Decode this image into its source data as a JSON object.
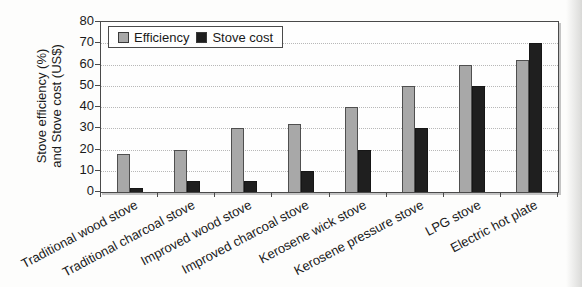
{
  "figure": {
    "y_axis_label_line1": "Stove efficiency (%)",
    "y_axis_label_line2": "and Stove cost (US$)"
  },
  "chart_data": {
    "type": "bar",
    "categories": [
      "Traditional wood stove",
      "Traditional charcoal stove",
      "Improved wood stove",
      "Improved charcoal stove",
      "Kerosene wick stove",
      "Kerosene pressure stove",
      "LPG stove",
      "Electric hot plate"
    ],
    "series": [
      {
        "name": "Efficiency",
        "values": [
          18,
          20,
          30,
          32,
          40,
          50,
          60,
          62
        ],
        "color": "#a8a8a8"
      },
      {
        "name": "Stove cost",
        "values": [
          2,
          5,
          5,
          10,
          20,
          30,
          50,
          70
        ],
        "color": "#1f1f1f"
      }
    ],
    "title": "",
    "xlabel": "",
    "ylabel": "Stove efficiency (%) and Stove cost (US$)",
    "ylim": [
      0,
      80
    ],
    "y_ticks": [
      80,
      70,
      60,
      50,
      40,
      30,
      20,
      10,
      0
    ],
    "grid": "horizontal-dotted",
    "legend_position": "top-left-inside"
  }
}
